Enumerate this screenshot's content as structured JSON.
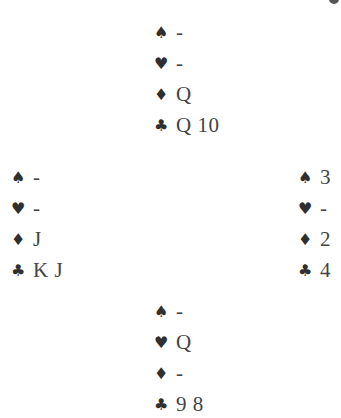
{
  "diagram": {
    "type": "bridge-deal",
    "hands": {
      "north": {
        "spades": "-",
        "hearts": "-",
        "diamonds": "Q",
        "clubs": "Q 10"
      },
      "west": {
        "spades": "-",
        "hearts": "-",
        "diamonds": "J",
        "clubs": "K J"
      },
      "east": {
        "spades": "3",
        "hearts": "-",
        "diamonds": "2",
        "clubs": "4"
      },
      "south": {
        "spades": "-",
        "hearts": "Q",
        "diamonds": "-",
        "clubs": "9 8"
      }
    },
    "suit_symbols": {
      "spades": "♠",
      "hearts": "♥",
      "diamonds": "♦",
      "clubs": "♣"
    }
  }
}
